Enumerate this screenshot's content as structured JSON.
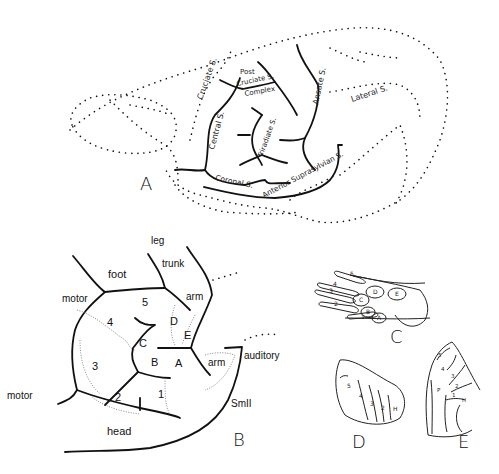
{
  "figure": {
    "panels": [
      {
        "id": "A",
        "label": "A",
        "description": "Lateral view of cerebral hemisphere with sulci",
        "sulci": {
          "cruciate": "Cruciate S.",
          "post_cruciate_1": "Post",
          "post_cruciate_2": "Cruciate S.",
          "post_cruciate_3": "Complex",
          "central": "Central S.",
          "triradiate": "Triradiate S.",
          "ansate": "Ansate S.",
          "lateral": "Lateral S.",
          "coronal": "Coronal S.",
          "anterior_suprasylvian": "Anterior Suprasylvian S."
        }
      },
      {
        "id": "B",
        "label": "B",
        "description": "Somatosensory map",
        "regions": {
          "leg": "leg",
          "trunk": "trunk",
          "foot": "foot",
          "motor_top": "motor",
          "motor_bottom": "motor",
          "arm_top": "arm",
          "arm_bottom": "arm",
          "auditory": "auditory",
          "smii": "SmII",
          "head": "head",
          "d1": "1",
          "d2": "2",
          "d3": "3",
          "d4": "4",
          "d5": "5",
          "pa": "A",
          "pb": "B",
          "pc": "C",
          "pd": "D",
          "pe": "E"
        }
      },
      {
        "id": "C",
        "label": "C",
        "description": "Forepaw with digit and pad labels",
        "digits": [
          "5",
          "4",
          "3",
          "2",
          "1"
        ],
        "pads": [
          "D",
          "E",
          "C",
          "B",
          "A"
        ]
      },
      {
        "id": "D",
        "label": "D",
        "strips": [
          "5",
          "4",
          "3",
          "2",
          "H"
        ]
      },
      {
        "id": "E",
        "label": "E",
        "strips": [
          "5",
          "4",
          "3",
          "2",
          "P",
          "1",
          "H"
        ]
      }
    ]
  }
}
